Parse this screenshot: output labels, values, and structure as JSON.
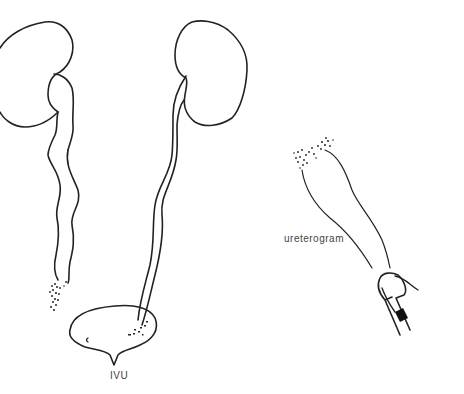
{
  "figure": {
    "panels": [
      {
        "id": "ivu",
        "label": "IVU"
      },
      {
        "id": "ureterogram",
        "label": "ureterogram"
      }
    ],
    "colors": {
      "ink": "#222222",
      "background": "#ffffff",
      "label": "#444444"
    }
  }
}
